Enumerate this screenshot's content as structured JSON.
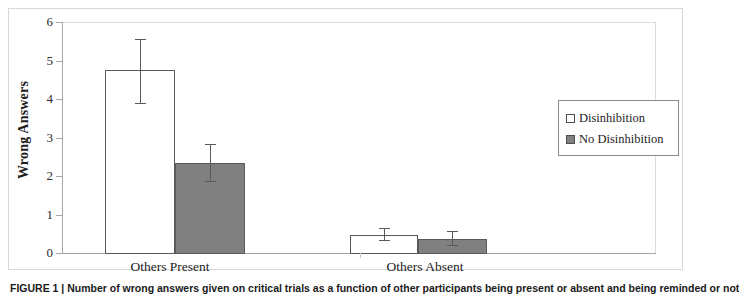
{
  "figure": {
    "caption_prefix": "FIGURE 1 |",
    "caption_text": "Number of wrong answers given on critical trials as a function of other participants being present or absent and being reminded or not"
  },
  "legend": {
    "position": "right",
    "entries": [
      {
        "label": "Disinhibition",
        "swatch": "open-square-icon",
        "color": "#ffffff"
      },
      {
        "label": "No Disinhibition",
        "swatch": "filled-square-icon",
        "color": "#808080"
      }
    ]
  },
  "axes": {
    "y_title": "Wrong Answers",
    "y_ticks": [
      "0",
      "1",
      "2",
      "3",
      "4",
      "5",
      "6"
    ],
    "x_categories": [
      "Others Present",
      "Others Absent"
    ]
  },
  "chart_data": {
    "type": "bar",
    "title": "",
    "xlabel": "",
    "ylabel": "Wrong Answers",
    "ylim": [
      0,
      6
    ],
    "yticks": [
      0,
      1,
      2,
      3,
      4,
      5,
      6
    ],
    "grid": false,
    "legend_position": "right",
    "categories": [
      "Others Present",
      "Others Absent"
    ],
    "series": [
      {
        "name": "Disinhibition",
        "color": "#ffffff",
        "edge_color": "#595959",
        "values": [
          4.75,
          0.47
        ],
        "error_low": [
          3.87,
          0.3
        ],
        "error_high": [
          5.55,
          0.64
        ]
      },
      {
        "name": "No Disinhibition",
        "color": "#808080",
        "edge_color": "#5a5a5a",
        "values": [
          2.33,
          0.36
        ],
        "error_low": [
          1.85,
          0.18
        ],
        "error_high": [
          2.82,
          0.56
        ]
      }
    ]
  }
}
